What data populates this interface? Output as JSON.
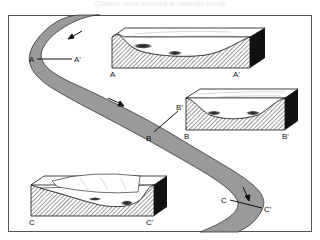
{
  "figure": {
    "caption": "Channel cross-sections at meander bends",
    "colors": {
      "river": "#9a9a9a",
      "river_edge": "#333333",
      "frame": "#555555",
      "block_dark": "#111111",
      "hatch": "#666666"
    }
  },
  "sections": [
    {
      "id": "A",
      "start_label": "A",
      "end_label": "A'",
      "block_start_label": "A",
      "block_end_label": "A'",
      "shape": "asymmetric-deep-left"
    },
    {
      "id": "B",
      "start_label": "B",
      "end_label": "B'",
      "block_start_label": "B",
      "block_end_label": "B'",
      "shape": "symmetric"
    },
    {
      "id": "C",
      "start_label": "C",
      "end_label": "C'",
      "block_start_label": "C",
      "block_end_label": "C'",
      "shape": "asymmetric-deep-right"
    }
  ],
  "flow_arrows": [
    "flow-arrow-upper",
    "flow-arrow-middle",
    "flow-arrow-lower"
  ]
}
